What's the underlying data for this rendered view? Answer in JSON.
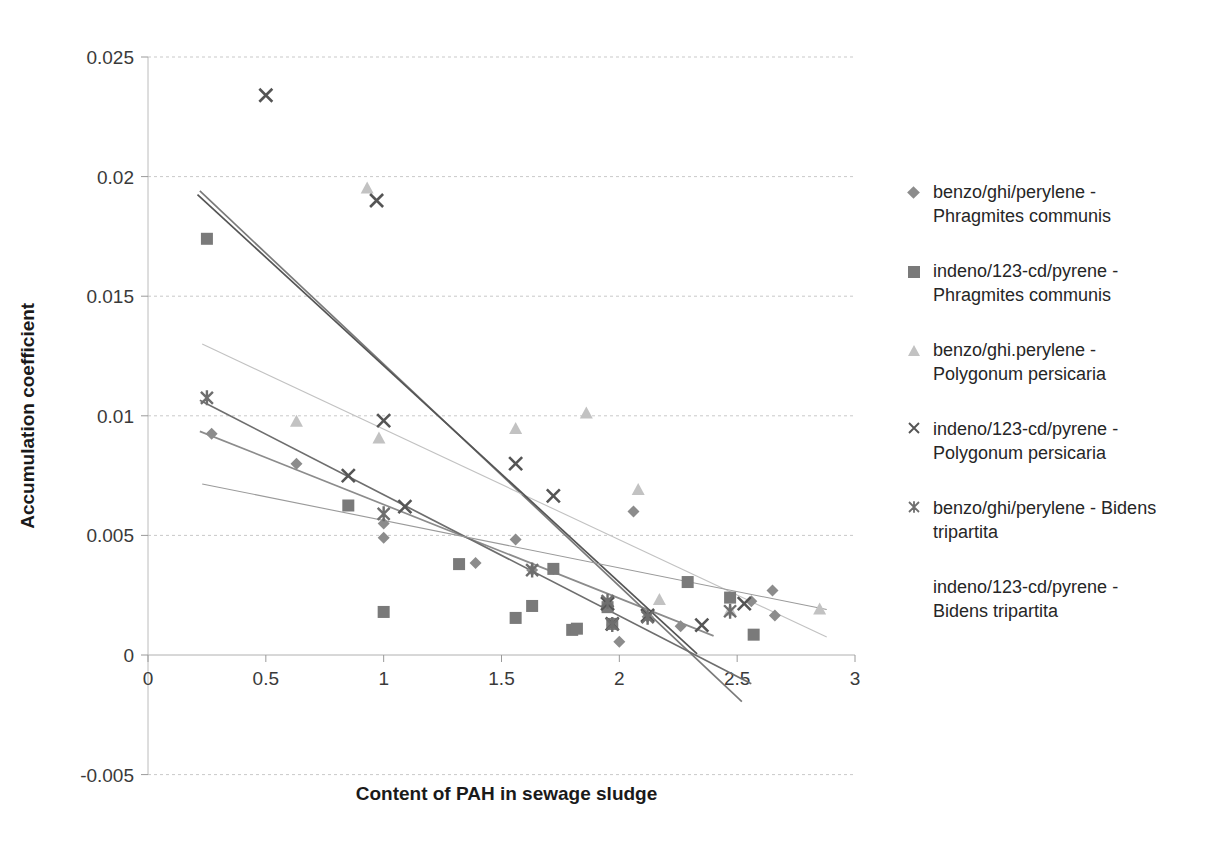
{
  "chart_data": {
    "type": "scatter",
    "title": "",
    "xlabel": "Content of PAH in sewage sludge",
    "ylabel": "Accumulation coefficient",
    "xlim": [
      0,
      3
    ],
    "ylim": [
      -0.005,
      0.025
    ],
    "xticks": [
      "0",
      "0.5",
      "1",
      "1.5",
      "2",
      "2.5",
      "3"
    ],
    "xtick_values": [
      0,
      0.5,
      1,
      1.5,
      2,
      2.5,
      3
    ],
    "yticks": [
      "-0.005",
      "0",
      "0.005",
      "0.01",
      "0.015",
      "0.02",
      "0.025"
    ],
    "ytick_values": [
      -0.005,
      0,
      0.005,
      0.01,
      0.015,
      0.02,
      0.025
    ],
    "grid": true,
    "grid_style": "dashed-horizontal",
    "legend_position": "right",
    "series": [
      {
        "name": "benzo/ghi/perylene - Phragmites communis",
        "marker": "diamond",
        "color": "#8c8c8c",
        "points": [
          [
            0.27,
            0.00925
          ],
          [
            0.63,
            0.008
          ],
          [
            1.0,
            0.0049
          ],
          [
            1.0,
            0.0055
          ],
          [
            1.39,
            0.00385
          ],
          [
            1.56,
            0.00483
          ],
          [
            1.63,
            0.00355
          ],
          [
            1.72,
            0.0036
          ],
          [
            1.95,
            0.00205
          ],
          [
            1.97,
            0.00125
          ],
          [
            2.0,
            0.00055
          ],
          [
            2.06,
            0.006
          ],
          [
            2.12,
            0.0016
          ],
          [
            2.26,
            0.0012
          ],
          [
            2.56,
            0.00225
          ],
          [
            2.65,
            0.0027
          ],
          [
            2.66,
            0.00165
          ]
        ],
        "trendline": {
          "x0": 0.22,
          "y0": 0.00935,
          "x1": 2.4,
          "y1": 0.0008
        }
      },
      {
        "name": "indeno/123-cd/pyrene - Phragmites communis",
        "marker": "square",
        "color": "#7a7a7a",
        "points": [
          [
            0.25,
            0.0174
          ],
          [
            0.85,
            0.00625
          ],
          [
            1.0,
            0.0018
          ],
          [
            1.32,
            0.0038
          ],
          [
            1.56,
            0.00155
          ],
          [
            1.63,
            0.00205
          ],
          [
            1.72,
            0.0036
          ],
          [
            1.8,
            0.00105
          ],
          [
            1.82,
            0.0011
          ],
          [
            1.95,
            0.002
          ],
          [
            1.97,
            0.0013
          ],
          [
            2.29,
            0.00305
          ],
          [
            2.47,
            0.0024
          ],
          [
            2.57,
            0.00085
          ]
        ],
        "trendline": {
          "x0": 0.22,
          "y0": 0.0194,
          "x1": 2.52,
          "y1": -0.00195
        }
      },
      {
        "name": "benzo/ghi.perylene - Polygonum persicaria",
        "marker": "triangle",
        "color": "#c2c2c2",
        "points": [
          [
            0.63,
            0.00975
          ],
          [
            0.93,
            0.0195
          ],
          [
            0.98,
            0.00905
          ],
          [
            1.56,
            0.00945
          ],
          [
            1.86,
            0.0101
          ],
          [
            2.08,
            0.0069
          ],
          [
            2.17,
            0.0023
          ],
          [
            2.47,
            0.00185
          ],
          [
            2.85,
            0.0019
          ]
        ],
        "trendline": {
          "x0": 0.23,
          "y0": 0.013,
          "x1": 2.88,
          "y1": 0.00075
        }
      },
      {
        "name": "indeno/123-cd/pyrene - Polygonum persicaria",
        "marker": "cross",
        "color": "#555555",
        "points": [
          [
            0.5,
            0.0234
          ],
          [
            0.97,
            0.019
          ],
          [
            0.85,
            0.0075
          ],
          [
            1.0,
            0.0098
          ],
          [
            1.09,
            0.0062
          ],
          [
            1.56,
            0.008
          ],
          [
            1.72,
            0.00665
          ],
          [
            1.95,
            0.00215
          ],
          [
            1.97,
            0.0013
          ],
          [
            2.12,
            0.00165
          ],
          [
            2.35,
            0.00125
          ],
          [
            2.53,
            0.00215
          ]
        ],
        "trendline": {
          "x0": 0.21,
          "y0": 0.01925,
          "x1": 2.33,
          "y1": 5e-05
        }
      },
      {
        "name": "benzo/ghi/perylene - Bidens tripartita",
        "marker": "star",
        "color": "#6e6e6e",
        "points": [
          [
            0.25,
            0.01075
          ],
          [
            1.0,
            0.0059
          ],
          [
            1.63,
            0.00355
          ],
          [
            1.95,
            0.00225
          ],
          [
            1.97,
            0.00128
          ],
          [
            2.12,
            0.00158
          ],
          [
            2.47,
            0.00183
          ]
        ],
        "trendline": {
          "x0": 0.22,
          "y0": 0.01065,
          "x1": 2.56,
          "y1": -0.0012
        }
      },
      {
        "name": "indeno/123-cd/pyrene - Bidens tripartita",
        "marker": "none",
        "color": "#9a9a9a",
        "points": [],
        "trendline": {
          "x0": 0.23,
          "y0": 0.00715,
          "x1": 2.88,
          "y1": 0.0019
        }
      }
    ]
  },
  "axes": {
    "x_title": "Content of PAH in sewage sludge",
    "y_title": "Accumulation coefficient"
  },
  "legend": {
    "items": [
      {
        "label": "benzo/ghi/perylene -\nPhragmites communis",
        "marker": "diamond"
      },
      {
        "label": "indeno/123-cd/pyrene -\nPhragmites communis",
        "marker": "square"
      },
      {
        "label": "benzo/ghi.perylene -\nPolygonum persicaria",
        "marker": "triangle"
      },
      {
        "label": "indeno/123-cd/pyrene -\nPolygonum persicaria",
        "marker": "cross"
      },
      {
        "label": "benzo/ghi/perylene - Bidens\ntripartita",
        "marker": "star"
      },
      {
        "label": "indeno/123-cd/pyrene -\nBidens tripartita",
        "marker": "none"
      }
    ]
  },
  "colors": {
    "grid": "#c9c9c9",
    "axis": "#a8a8a8",
    "text": "#262626"
  }
}
